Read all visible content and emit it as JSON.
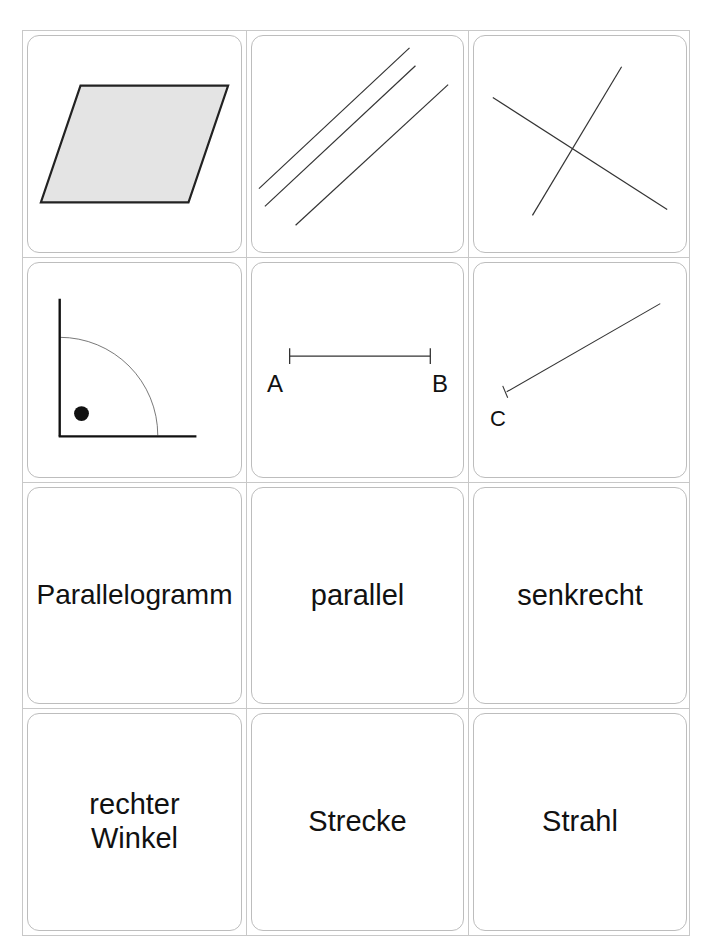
{
  "sheet": {
    "title": "Geometrie-Memory Karten",
    "columns": 3,
    "rows": 4,
    "line_color": "#c8c8c8",
    "card_border_color": "#bdbdbd",
    "ink_color": "#222222",
    "fill_color": "#e4e4e4"
  },
  "picture_cards": [
    {
      "id": "parallelogram",
      "icon": "parallelogram-icon"
    },
    {
      "id": "parallel-lines",
      "icon": "parallel-lines-icon"
    },
    {
      "id": "perpendicular-lines",
      "icon": "perpendicular-lines-icon"
    },
    {
      "id": "right-angle",
      "icon": "right-angle-icon"
    },
    {
      "id": "line-segment",
      "icon": "line-segment-icon",
      "labels": {
        "start": "A",
        "end": "B"
      }
    },
    {
      "id": "ray",
      "icon": "ray-icon",
      "labels": {
        "start": "C"
      }
    }
  ],
  "word_cards": [
    {
      "id": "parallelogram",
      "text": "Parallelogramm"
    },
    {
      "id": "parallel-lines",
      "text": "parallel"
    },
    {
      "id": "perpendicular-lines",
      "text": "senkrecht"
    },
    {
      "id": "right-angle",
      "line1": "rechter",
      "line2": "Winkel"
    },
    {
      "id": "line-segment",
      "text": "Strecke"
    },
    {
      "id": "ray",
      "text": "Strahl"
    }
  ]
}
